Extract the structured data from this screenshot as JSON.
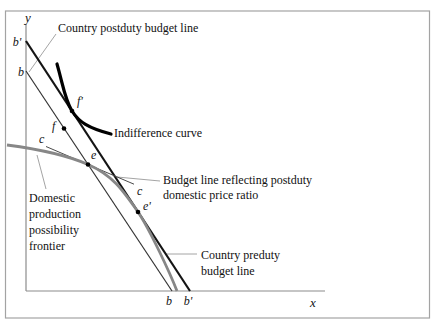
{
  "figure": {
    "axis": {
      "x_label": "x",
      "y_label": "y"
    },
    "intercepts": {
      "y_axis_outer": "b'",
      "y_axis_inner": "b",
      "x_axis_inner": "b",
      "x_axis_outer": "b'"
    },
    "points": {
      "f_prime": "f'",
      "f": "f",
      "e": "e",
      "e_prime": "e'",
      "c_upper": "c",
      "c_lower": "c"
    },
    "annotations": {
      "postduty_budget_line": "Country postduty budget line",
      "indifference_curve": "Indifference curve",
      "domestic_price_line_1": "Budget line reflecting postduty",
      "domestic_price_line_2": "domestic price ratio",
      "ppf_line_1": "Domestic",
      "ppf_line_2": "production",
      "ppf_line_3": "possibility",
      "ppf_line_4": "frontier",
      "preduty_line_1": "Country preduty",
      "preduty_line_2": "budget line"
    },
    "colors": {
      "indifference_curve": "#000000",
      "preduty_line": "#141414",
      "postduty_line": "#333333",
      "ppf": "#878787",
      "domestic_price_line": "#4a4a4a",
      "axis": "#8c8c8c",
      "leader": "#9a9a9a",
      "frame": "#a3a3a3",
      "point": "#000000"
    }
  }
}
